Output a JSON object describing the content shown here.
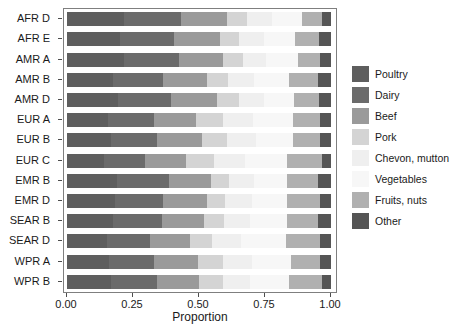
{
  "chart_data": {
    "type": "bar",
    "orientation": "horizontal",
    "stacked": true,
    "normalized": true,
    "title": "",
    "xlabel": "Proportion",
    "ylabel": "",
    "xlim": [
      0.0,
      1.0
    ],
    "xticks": [
      0.0,
      0.25,
      0.5,
      0.75,
      1.0
    ],
    "xticklabels": [
      "0.00",
      "0.25",
      "0.50",
      "0.75",
      "1.00"
    ],
    "grid": false,
    "legend_position": "right",
    "categories": [
      "AFR D",
      "AFR E",
      "AMR A",
      "AMR B",
      "AMR D",
      "EUR A",
      "EUR B",
      "EUR C",
      "EMR B",
      "EMR D",
      "SEAR B",
      "SEAR D",
      "WPR A",
      "WPR B"
    ],
    "series": [
      {
        "name": "Poultry",
        "color": "#5e5e5e",
        "values": [
          0.215,
          0.2,
          0.215,
          0.175,
          0.195,
          0.155,
          0.165,
          0.14,
          0.19,
          0.18,
          0.175,
          0.15,
          0.16,
          0.165
        ]
      },
      {
        "name": "Dairy",
        "color": "#6b6b6b",
        "values": [
          0.215,
          0.205,
          0.21,
          0.19,
          0.2,
          0.175,
          0.175,
          0.155,
          0.195,
          0.185,
          0.185,
          0.165,
          0.17,
          0.175
        ]
      },
      {
        "name": "Beef",
        "color": "#9a9a9a",
        "values": [
          0.175,
          0.175,
          0.165,
          0.165,
          0.175,
          0.16,
          0.17,
          0.155,
          0.16,
          0.165,
          0.16,
          0.15,
          0.165,
          0.16
        ]
      },
      {
        "name": "Pork",
        "color": "#d4d4d4",
        "values": [
          0.075,
          0.07,
          0.075,
          0.08,
          0.08,
          0.1,
          0.095,
          0.105,
          0.07,
          0.07,
          0.075,
          0.085,
          0.095,
          0.09
        ]
      },
      {
        "name": "Chevon, mutton",
        "color": "#efefef",
        "values": [
          0.095,
          0.095,
          0.09,
          0.1,
          0.095,
          0.115,
          0.11,
          0.12,
          0.095,
          0.1,
          0.1,
          0.11,
          0.11,
          0.105
        ]
      },
      {
        "name": "Vegetables",
        "color": "#f7f7f7",
        "values": [
          0.115,
          0.12,
          0.12,
          0.13,
          0.115,
          0.15,
          0.14,
          0.16,
          0.125,
          0.135,
          0.14,
          0.17,
          0.15,
          0.145
        ]
      },
      {
        "name": "Fruits, nuts",
        "color": "#b0b0b0",
        "values": [
          0.075,
          0.09,
          0.085,
          0.11,
          0.095,
          0.105,
          0.105,
          0.13,
          0.115,
          0.125,
          0.115,
          0.13,
          0.11,
          0.125
        ]
      },
      {
        "name": "Other",
        "color": "#555555",
        "values": [
          0.035,
          0.045,
          0.04,
          0.05,
          0.045,
          0.04,
          0.04,
          0.035,
          0.05,
          0.04,
          0.05,
          0.04,
          0.04,
          0.035
        ]
      }
    ]
  },
  "axis": {
    "x_title": "Proportion"
  }
}
